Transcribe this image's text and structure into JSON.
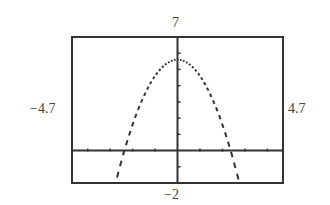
{
  "chart_data": {
    "type": "line",
    "title": "",
    "xlabel": "",
    "ylabel": "",
    "window": {
      "xmin": -4.7,
      "xmax": 4.7,
      "ymin": -2,
      "ymax": 7
    },
    "labels": {
      "top": "7",
      "bottom": "−2",
      "left": "−4.7",
      "right": "4.7"
    },
    "grid": false,
    "tick_spacing": {
      "x": 1,
      "y": 1
    },
    "series": [
      {
        "name": "f(x)",
        "expression": "5.6 - x^2",
        "style": "dotted-pixel",
        "vertex": [
          0,
          5.6
        ],
        "x_intercepts": [
          -2.37,
          2.37
        ]
      }
    ]
  }
}
